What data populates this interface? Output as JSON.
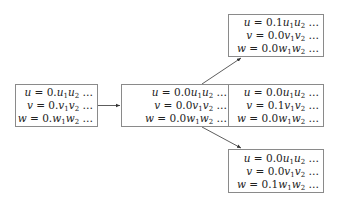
{
  "diagram": {
    "type": "tree",
    "nodes": [
      {
        "id": "root",
        "lines": [
          {
            "var": "u",
            "prefix": "0.",
            "digit": "u"
          },
          {
            "var": "v",
            "prefix": "0.",
            "digit": "v"
          },
          {
            "var": "w",
            "prefix": "0.",
            "digit": "w"
          }
        ],
        "text": [
          "u = 0.u₁u₂ …",
          "v = 0.v₁v₂ …",
          "w = 0.w₁w₂ …"
        ]
      },
      {
        "id": "mid",
        "prefix": [
          "0.0",
          "0.0",
          "0.0"
        ],
        "text": [
          "u = 0.0u₁u₂ …",
          "v = 0.0v₁v₂ …",
          "w = 0.0w₁w₂ …"
        ]
      },
      {
        "id": "out_u",
        "prefix": [
          "0.1",
          "0.0",
          "0.0"
        ],
        "text": [
          "u = 0.1u₁u₂ …",
          "v = 0.0v₁v₂ …",
          "w = 0.0w₁w₂ …"
        ]
      },
      {
        "id": "out_v",
        "prefix": [
          "0.0",
          "0.1",
          "0.0"
        ],
        "text": [
          "u = 0.0u₁u₂ …",
          "v = 0.1v₁v₂ …",
          "w = 0.0w₁w₂ …"
        ]
      },
      {
        "id": "out_w",
        "prefix": [
          "0.0",
          "0.0",
          "0.1"
        ],
        "text": [
          "u = 0.0u₁u₂ …",
          "v = 0.0v₁v₂ …",
          "w = 0.1w₁w₂ …"
        ]
      }
    ],
    "edges": [
      {
        "from": "root",
        "to": "mid"
      },
      {
        "from": "mid",
        "to": "out_u"
      },
      {
        "from": "mid",
        "to": "out_v"
      },
      {
        "from": "mid",
        "to": "out_w"
      }
    ],
    "labels": {
      "u": "u",
      "v": "v",
      "w": "w",
      "eq": " = ",
      "ellipsis": " …",
      "sub1": "1",
      "sub2": "2"
    },
    "prefixes": {
      "root": [
        "0.",
        "0.",
        "0."
      ],
      "mid": [
        "0.0",
        "0.0",
        "0.0"
      ],
      "out_u": [
        "0.1",
        "0.0",
        "0.0"
      ],
      "out_v": [
        "0.0",
        "0.1",
        "0.0"
      ],
      "out_w": [
        "0.0",
        "0.0",
        "0.1"
      ]
    }
  },
  "colors": {
    "border": "#8a8a8a",
    "arrow": "#333333",
    "text": "#222222"
  }
}
